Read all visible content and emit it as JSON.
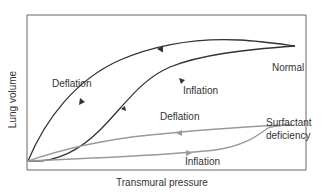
{
  "diagram": {
    "title": "",
    "x_axis_label": "Transmural pressure",
    "y_axis_label": "Lung volume",
    "colors": {
      "frame": "#666666",
      "normal_curve": "#333333",
      "surfactant_curve": "#999999",
      "text": "#333333"
    },
    "curves": {
      "normal": {
        "label": "Normal",
        "deflation_label": "Deflation",
        "inflation_label": "Inflation"
      },
      "surfactant_deficiency": {
        "label_line1": "Surfactant",
        "label_line2": "deficiency",
        "deflation_label": "Deflation",
        "inflation_label": "Inflation"
      }
    }
  }
}
